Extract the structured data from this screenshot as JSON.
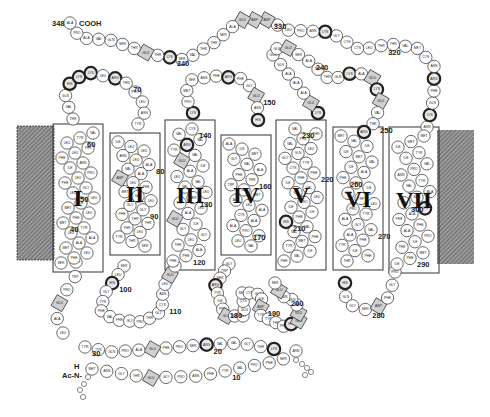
{
  "termini": {
    "c_term_number": "348",
    "c_term_residue": "ALA",
    "c_term_label": "COOH",
    "n_term_h": "H",
    "n_term_label": "Ac-N-"
  },
  "legend_styles": {
    "charged_positive": "bold ring",
    "charged_negative": "shaded square"
  },
  "helices": [
    {
      "id": "I",
      "label": "I"
    },
    {
      "id": "II",
      "label": "II"
    },
    {
      "id": "III",
      "label": "III"
    },
    {
      "id": "IV",
      "label": "IV"
    },
    {
      "id": "V",
      "label": "V"
    },
    {
      "id": "VI",
      "label": "VI"
    },
    {
      "id": "VII",
      "label": "VII"
    }
  ],
  "segments": {
    "nterm_row1": {
      "residues": [
        "MET",
        "ASN",
        "GLY",
        "THR",
        "GLU",
        "GLY",
        "PRO",
        "ASN",
        "PHE",
        "TYR",
        "VAL",
        "PRO",
        "PHE",
        "SER",
        "ASN"
      ],
      "numbers": {
        "10": 9
      }
    },
    "nterm_row2": {
      "residues": [
        "LYS",
        "THR",
        "GLY",
        "VAL",
        "VAL",
        "ARG",
        "SER",
        "PRO",
        "PHE",
        "GLU",
        "ALA",
        "PRO",
        "GLN",
        "TYR",
        "TYR"
      ],
      "numbers": {
        "20": 5,
        "30": 14
      }
    },
    "loop_n_to_I": {
      "residues": [
        "LEU",
        "ALA",
        "GLU",
        "PRO",
        "TRP",
        "GLN"
      ]
    },
    "helix_I": {
      "residues": [
        "SER",
        "PHE",
        "LEU",
        "MET",
        "ALA",
        "ALA",
        "LEU",
        "TYR",
        "MET",
        "PHE",
        "LEU",
        "MET",
        "ILE",
        "LEU",
        "LEU",
        "GLY",
        "PHE",
        "LEU",
        "PRO",
        "ILE",
        "ASN",
        "PHE",
        "LEU",
        "THR",
        "LEU",
        "TYR",
        "VAL"
      ],
      "numbers": {
        "40": 8,
        "50": 14,
        "60": 25
      }
    },
    "loop_I_II": {
      "residues": [
        "THR",
        "VAL",
        "GLN",
        "HIS",
        "LYS",
        "LYS",
        "LEU",
        "ARG",
        "THR",
        "PRO",
        "LEU",
        "ASN",
        "TYR"
      ],
      "numbers": {
        "70": 8
      }
    },
    "helix_II": {
      "residues": [
        "ILE",
        "LEU",
        "LEU",
        "ASN",
        "LEU",
        "ALA",
        "VAL",
        "ALA",
        "ASP",
        "LEU",
        "PHE",
        "MET",
        "VAL",
        "LEU",
        "GLY",
        "GLY",
        "PHE",
        "THR",
        "THR",
        "THR",
        "LEU",
        "TYR",
        "THR",
        "SER"
      ],
      "numbers": {
        "80": 5,
        "90": 15
      }
    },
    "loop_II_III": {
      "residues": [
        "SER",
        "LEU",
        "HIS",
        "GLY",
        "TYR",
        "PHE",
        "VAL",
        "PHE",
        "GLY",
        "PRO",
        "THR",
        "GLY",
        "CYS",
        "ASN",
        "LEU",
        "GLU",
        "GLY"
      ],
      "numbers": {
        "100": 2,
        "110": 12
      }
    },
    "helix_III": {
      "residues": [
        "PHE",
        "PHE",
        "ALA",
        "THR",
        "LEU",
        "GLY",
        "GLY",
        "ILE",
        "GLU",
        "ALA",
        "LEU",
        "TRP",
        "SER",
        "LEU",
        "VAL",
        "VAL",
        "LEU",
        "ALA",
        "ILE",
        "GLU",
        "VAL",
        "TYR",
        "ARG",
        "VAL",
        "VAL",
        "CYS"
      ],
      "numbers": {
        "120": 1,
        "130": 12,
        "140": 25
      }
    },
    "loop_III_IV": {
      "residues": [
        "LYS",
        "PRO",
        "MET",
        "SER",
        "ASN",
        "PHE",
        "ARG",
        "PHE",
        "GLY",
        "GLU",
        "ASN",
        "HIS"
      ],
      "numbers": {
        "150": 9
      }
    },
    "helix_IV": {
      "residues": [
        "ALA",
        "ILE",
        "MET",
        "GLY",
        "VAL",
        "ALA",
        "PHE",
        "THR",
        "TRP",
        "VAL",
        "MET",
        "ALA",
        "LEU",
        "ALA",
        "CYS",
        "ALA",
        "ALA",
        "PRO",
        "PRO",
        "LEU",
        "VAL"
      ],
      "numbers": {
        "160": 7,
        "170": 17
      }
    },
    "loop_IV_V": {
      "residues": [
        "GLY",
        "TRP",
        "SER",
        "ARG",
        "TYR",
        "ILE",
        "PRO",
        "GLU",
        "GLY",
        "MET",
        "GLN",
        "CYS",
        "SER",
        "CYS",
        "GLY",
        "ILE",
        "ASP",
        "TYR",
        "TYR",
        "THR",
        "PRO",
        "HIS",
        "GLU",
        "GLU",
        "THR",
        "ASN",
        "ASN",
        "GLU",
        "SER"
      ],
      "numbers": {
        "180": 6,
        "190": 16,
        "200": 26
      }
    },
    "helix_V": {
      "residues": [
        "PHE",
        "VAL",
        "ILE",
        "TYR",
        "MET",
        "PHE",
        "VAL",
        "VAL",
        "HIS",
        "PHE",
        "ILE",
        "ILE",
        "PRO",
        "LEU",
        "ILE",
        "VAL",
        "ILE",
        "PHE",
        "PHE",
        "CYS",
        "TYR",
        "GLY",
        "GLN",
        "LEU",
        "VAL",
        "PHE",
        "THR",
        "VAL"
      ],
      "numbers": {
        "210": 8,
        "220": 18,
        "230": 27
      }
    },
    "loop_V_VI": {
      "residues": [
        "LYS",
        "GLU",
        "ALA",
        "ALA",
        "ALA",
        "GLN",
        "GLN",
        "GLN",
        "GLU",
        "SER",
        "ALA",
        "THR",
        "THR",
        "GLN",
        "LYS",
        "ALA",
        "GLU",
        "LYS",
        "GLU",
        "VAL",
        "THR",
        "ARG"
      ],
      "numbers": {
        "240": 10,
        "250": 20
      }
    },
    "helix_VI": {
      "residues": [
        "MET",
        "VAL",
        "ILE",
        "ILE",
        "MET",
        "VAL",
        "ILE",
        "ALA",
        "PHE",
        "LEU",
        "ILE",
        "CYS",
        "TRP",
        "LEU",
        "PRO",
        "TYR",
        "ALA",
        "GLY",
        "VAL",
        "ALA",
        "PHE",
        "TYR",
        "ILE",
        "PHE",
        "THR"
      ],
      "numbers": {
        "260": 8,
        "270": 18
      }
    },
    "loop_VI_VII": {
      "residues": [
        "HIS",
        "GLN",
        "GLY",
        "SER",
        "ASP",
        "PHE",
        "GLY",
        "PRO"
      ],
      "numbers": {
        "280": 3
      }
    },
    "helix_VII": {
      "residues": [
        "ILE",
        "PHE",
        "MET",
        "THR",
        "ILE",
        "PRO",
        "ALA",
        "PHE",
        "PHE",
        "ALA",
        "LYS",
        "THR",
        "SER",
        "ALA",
        "VAL",
        "TYR",
        "ASN",
        "PRO",
        "VAL",
        "ILE",
        "TYR",
        "ILE",
        "MET",
        "MET"
      ],
      "numbers": {
        "290": 1,
        "300": 11,
        "310": 24
      }
    },
    "cterm": {
      "residues": [
        "ASN",
        "LYS",
        "GLN",
        "PHE",
        "ARG",
        "ASN",
        "CYS",
        "MET",
        "VAL",
        "THR",
        "THR",
        "LEU",
        "CYS",
        "CYS",
        "GLY",
        "LYS",
        "ASN",
        "PRO",
        "LEU",
        "GLY",
        "ASP",
        "ASP",
        "GLU",
        "ALA",
        "SER",
        "THR",
        "THR",
        "VAL",
        "SER",
        "LYS",
        "THR",
        "GLU",
        "THR",
        "SER",
        "GLN",
        "VAL",
        "ALA",
        "PRO",
        "ALA"
      ],
      "numbers": {
        "320": 10,
        "330": 20,
        "340": 29
      }
    }
  },
  "positive_residues": [
    "LYS",
    "ARG",
    "HIS"
  ],
  "negative_residues": [
    "GLU",
    "ASP"
  ]
}
